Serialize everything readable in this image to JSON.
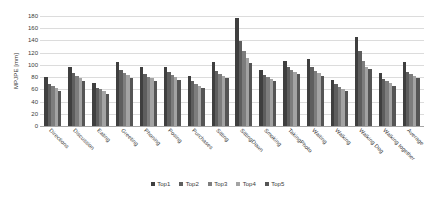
{
  "chart_data": {
    "type": "bar",
    "title": "",
    "xlabel": "",
    "ylabel": "MPJPE [mm]",
    "ylim": [
      0,
      180
    ],
    "ytick_step": 20,
    "yticks": [
      0,
      20,
      40,
      60,
      80,
      100,
      120,
      140,
      160,
      180
    ],
    "grid": true,
    "legend_position": "bottom",
    "categories": [
      "Directions",
      "Discussion",
      "Eating",
      "Greeting",
      "Phoning",
      "Posing",
      "Purchases",
      "Sitting",
      "SittingDown",
      "Smoking",
      "TakingPhoto",
      "Waiting",
      "Walking",
      "Walking Dog",
      "Walking together",
      "Average"
    ],
    "series": [
      {
        "name": "Top1",
        "color": "#3f3f3f",
        "values": [
          80,
          96,
          70,
          104,
          96,
          97,
          82,
          104,
          176,
          92,
          107,
          109,
          75,
          145,
          86,
          104
        ]
      },
      {
        "name": "Top2",
        "color": "#5e5e5e",
        "values": [
          69,
          86,
          62,
          91,
          85,
          88,
          73,
          90,
          139,
          84,
          96,
          97,
          68,
          122,
          77,
          89
        ]
      },
      {
        "name": "Top3",
        "color": "#7d7d7d",
        "values": [
          65,
          82,
          60,
          87,
          81,
          83,
          69,
          85,
          122,
          80,
          92,
          90,
          64,
          107,
          73,
          85
        ]
      },
      {
        "name": "Top4",
        "color": "#a3a3a3",
        "values": [
          62,
          79,
          57,
          83,
          78,
          80,
          66,
          82,
          112,
          77,
          89,
          86,
          61,
          96,
          70,
          82
        ]
      },
      {
        "name": "Top5",
        "color": "#555555",
        "values": [
          58,
          74,
          53,
          78,
          73,
          76,
          62,
          78,
          103,
          73,
          85,
          82,
          57,
          94,
          66,
          78
        ]
      }
    ]
  },
  "legend": {
    "items": [
      {
        "label": "Top1"
      },
      {
        "label": "Top2"
      },
      {
        "label": "Top3"
      },
      {
        "label": "Top4"
      },
      {
        "label": "Top5"
      }
    ]
  }
}
